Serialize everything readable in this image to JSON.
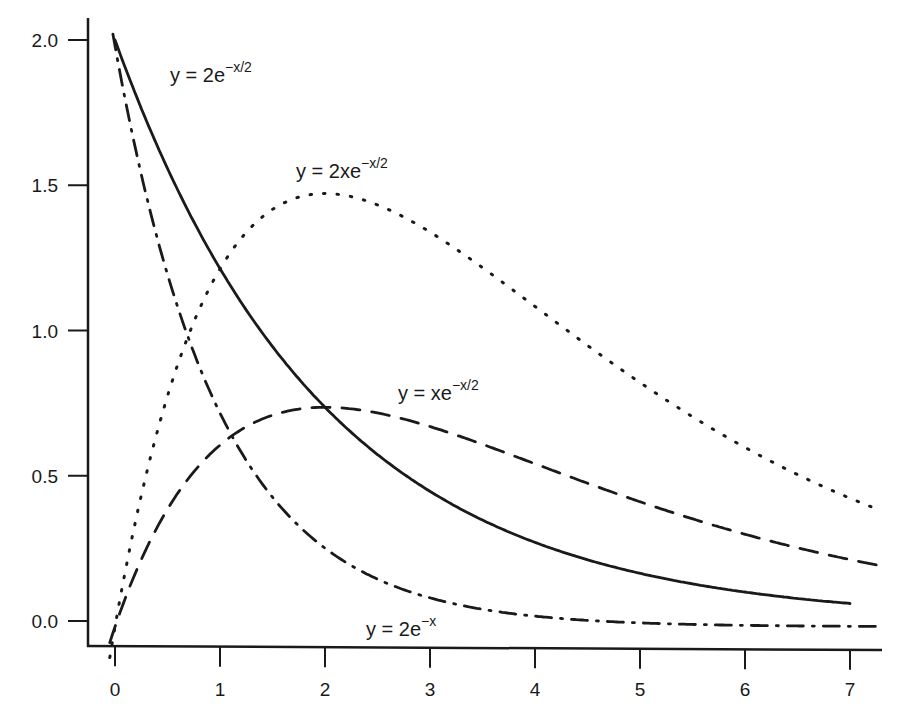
{
  "chart_data": {
    "type": "line",
    "title": "",
    "xlabel": "",
    "ylabel": "",
    "xlim": [
      -0.25,
      7.3
    ],
    "ylim": [
      -0.09,
      2.1
    ],
    "grid": false,
    "legend": "inline labels",
    "x_ticks": [
      "0",
      "1",
      "2",
      "3",
      "4",
      "5",
      "6",
      "7"
    ],
    "y_ticks": [
      "0.0",
      "0.5",
      "1.0",
      "1.5",
      "2.0"
    ],
    "series": [
      {
        "name": "y = 2e^(-x/2)",
        "label_main": "y = 2e",
        "label_sup": "−x/2",
        "style": "solid",
        "x": [
          0,
          0.5,
          1,
          1.5,
          2,
          2.5,
          3,
          3.5,
          4,
          4.5,
          5,
          5.5,
          6,
          6.5,
          7
        ],
        "values": [
          2.0,
          1.56,
          1.21,
          0.94,
          0.74,
          0.57,
          0.45,
          0.35,
          0.27,
          0.21,
          0.16,
          0.13,
          0.1,
          0.08,
          0.06
        ]
      },
      {
        "name": "y = 2xe^(-x/2)",
        "label_main": "y = 2xe",
        "label_sup": "−x/2",
        "style": "dotted",
        "x": [
          0,
          0.5,
          1,
          1.5,
          2,
          2.5,
          3,
          3.5,
          4,
          4.5,
          5,
          5.5,
          6,
          6.5,
          7
        ],
        "values": [
          0.0,
          0.78,
          1.21,
          1.42,
          1.47,
          1.43,
          1.34,
          1.22,
          1.08,
          0.95,
          0.82,
          0.7,
          0.6,
          0.5,
          0.42
        ]
      },
      {
        "name": "y = xe^(-x/2)",
        "label_main": "y = xe",
        "label_sup": "−x/2",
        "style": "dashed",
        "x": [
          0,
          0.5,
          1,
          1.5,
          2,
          2.5,
          3,
          3.5,
          4,
          4.5,
          5,
          5.5,
          6,
          6.5,
          7
        ],
        "values": [
          0.0,
          0.39,
          0.61,
          0.71,
          0.74,
          0.72,
          0.67,
          0.61,
          0.54,
          0.47,
          0.41,
          0.35,
          0.3,
          0.25,
          0.21
        ]
      },
      {
        "name": "y = 2e^(-x)",
        "label_main": "y = 2e",
        "label_sup": "−x",
        "style": "dash-dot",
        "x": [
          0,
          0.5,
          1,
          1.5,
          2,
          2.5,
          3,
          3.5,
          4,
          4.5,
          5,
          5.5,
          6,
          6.5,
          7
        ],
        "values": [
          2.0,
          1.21,
          0.74,
          0.45,
          0.27,
          0.16,
          0.1,
          0.06,
          0.04,
          0.02,
          0.01,
          0.01,
          0.0,
          0.0,
          0.0
        ]
      }
    ]
  }
}
